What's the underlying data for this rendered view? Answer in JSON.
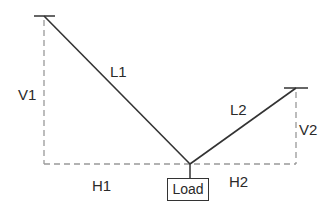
{
  "diagram": {
    "labels": {
      "L1": "L1",
      "L2": "L2",
      "V1": "V1",
      "V2": "V2",
      "H1": "H1",
      "H2": "H2",
      "load": "Load"
    },
    "colors": {
      "line": "#333333",
      "dashed": "#999999"
    },
    "points": {
      "left_anchor": [
        44,
        16
      ],
      "right_anchor": [
        296,
        88
      ],
      "junction": [
        190,
        164
      ],
      "load_top": [
        190,
        178
      ]
    }
  }
}
